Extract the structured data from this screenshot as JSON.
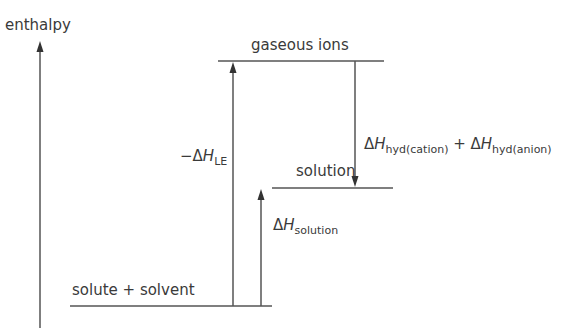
{
  "diagram": {
    "type": "enthalpy-level-diagram",
    "axis_label": "enthalpy",
    "levels": {
      "gaseous_ions": "gaseous ions",
      "solution": "solution",
      "solute_solvent": "solute + solvent"
    },
    "arrows": {
      "lattice": {
        "prefix": "−Δ",
        "symbol": "H",
        "subscript": "LE"
      },
      "solution": {
        "prefix": "Δ",
        "symbol": "H",
        "subscript": "solution"
      },
      "hydration": {
        "prefix1": "Δ",
        "symbol1": "H",
        "subscript1": "hyd(cation)",
        "plus": " + ",
        "prefix2": "Δ",
        "symbol2": "H",
        "subscript2": "hyd(anion)"
      }
    },
    "colors": {
      "line": "#555555",
      "text": "#3a3a3a"
    }
  }
}
